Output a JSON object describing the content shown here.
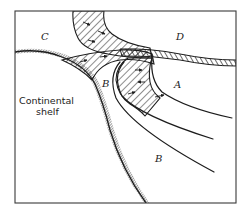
{
  "figure": {
    "type": "schematic",
    "labels": {
      "region_c": "C",
      "region_d": "D",
      "region_a": "A",
      "region_b_upper": "B",
      "region_b_lower": "B",
      "shelf_line1": "Continental",
      "shelf_line2": "shelf"
    },
    "colors": {
      "ink": "#1c1c1c",
      "frame": "#3a3a3a",
      "background": "#ffffff"
    }
  }
}
